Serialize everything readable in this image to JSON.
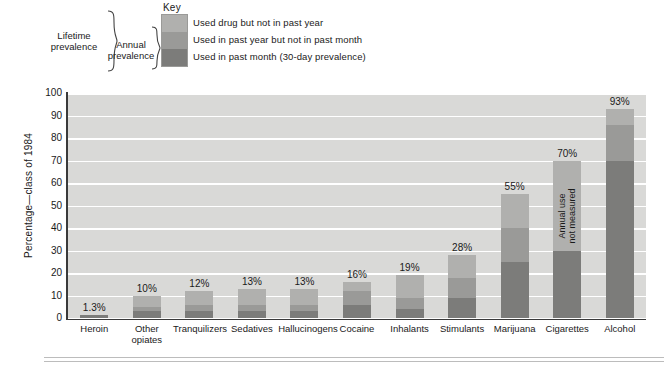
{
  "key": {
    "title": "Key",
    "items": [
      {
        "label": "Used drug but not in past year",
        "color": "#b0b0ae"
      },
      {
        "label": "Used in past year but not in past month",
        "color": "#9a9a98"
      },
      {
        "label": "Used in past month (30-day prevalence)",
        "color": "#7c7c7a"
      }
    ],
    "brackets": [
      {
        "label": "Lifetime\nprevalence",
        "line1": "Lifetime",
        "line2": "prevalence"
      },
      {
        "label": "Annual\nprevalence",
        "line1": "Annual",
        "line2": "prevalence"
      }
    ]
  },
  "chart_data": {
    "type": "bar",
    "subtype": "stacked",
    "title": "",
    "xlabel": "",
    "ylabel": "Percentage—class of 1984",
    "ylim": [
      0,
      100
    ],
    "ytick_labels": [
      "100",
      "90",
      "80",
      "70",
      "60",
      "50",
      "40",
      "30",
      "20",
      "10",
      "0"
    ],
    "ytick_values": [
      100,
      90,
      80,
      70,
      60,
      50,
      40,
      30,
      20,
      10,
      0
    ],
    "grid": true,
    "grid_axis": "y",
    "legend_position": "top",
    "plot_background": "#d9d9d7",
    "categories": [
      "Heroin",
      "Other opiates",
      "Tranquilizers",
      "Sedatives",
      "Hallucinogens",
      "Cocaine",
      "Inhalants",
      "Stimulants",
      "Marijuana",
      "Cigarettes",
      "Alcohol"
    ],
    "category_lines": [
      [
        "Heroin"
      ],
      [
        "Other",
        "opiates"
      ],
      [
        "Tranquilizers"
      ],
      [
        "Sedatives"
      ],
      [
        "Hallucinogens"
      ],
      [
        "Cocaine"
      ],
      [
        "Inhalants"
      ],
      [
        "Stimulants"
      ],
      [
        "Marijuana"
      ],
      [
        "Cigarettes"
      ],
      [
        "Alcohol"
      ]
    ],
    "series": [
      {
        "name": "Used in past month (30-day prevalence)",
        "color": "#7c7c7a",
        "values": [
          1.3,
          3,
          3,
          3,
          3,
          6,
          4,
          9,
          25,
          30,
          70
        ]
      },
      {
        "name": "Used in past year but not in past month",
        "color": "#9a9a98",
        "values": [
          0,
          2,
          3,
          3,
          3,
          6,
          5,
          9,
          15,
          0,
          16
        ]
      },
      {
        "name": "Used drug but not in past year",
        "color": "#b0b0ae",
        "values": [
          0,
          5,
          6,
          7,
          7,
          4,
          10,
          10,
          15,
          40,
          7
        ]
      }
    ],
    "totals": [
      1.3,
      10,
      12,
      13,
      13,
      16,
      19,
      28,
      55,
      70,
      93
    ],
    "data_labels": [
      "1.3%",
      "10%",
      "12%",
      "13%",
      "13%",
      "16%",
      "19%",
      "28%",
      "55%",
      "70%",
      "93%"
    ],
    "annotations": [
      {
        "category": "Cigarettes",
        "text_line1": "Annual use",
        "text_line2": "not measured",
        "rotated": true
      }
    ]
  }
}
